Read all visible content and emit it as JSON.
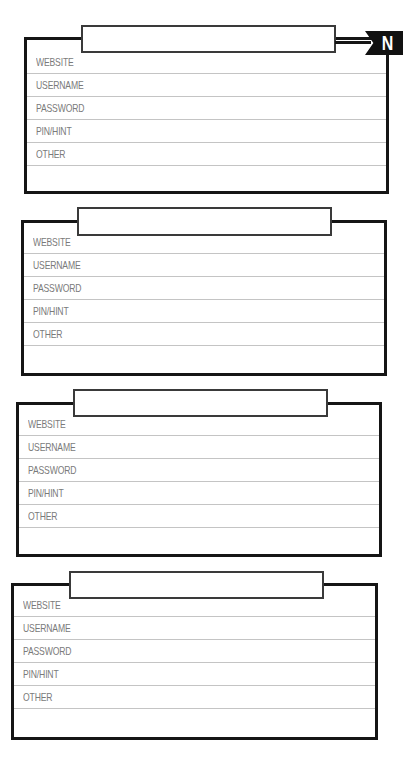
{
  "badge": {
    "letter": "N"
  },
  "cards": [
    {
      "tab_value": "",
      "fields": [
        {
          "label": "WEBSITE",
          "value": ""
        },
        {
          "label": "USERNAME",
          "value": ""
        },
        {
          "label": "PASSWORD",
          "value": ""
        },
        {
          "label": "PIN/HINT",
          "value": ""
        },
        {
          "label": "OTHER",
          "value": ""
        }
      ]
    },
    {
      "tab_value": "",
      "fields": [
        {
          "label": "WEBSITE",
          "value": ""
        },
        {
          "label": "USERNAME",
          "value": ""
        },
        {
          "label": "PASSWORD",
          "value": ""
        },
        {
          "label": "PIN/HINT",
          "value": ""
        },
        {
          "label": "OTHER",
          "value": ""
        }
      ]
    },
    {
      "tab_value": "",
      "fields": [
        {
          "label": "WEBSITE",
          "value": ""
        },
        {
          "label": "USERNAME",
          "value": ""
        },
        {
          "label": "PASSWORD",
          "value": ""
        },
        {
          "label": "PIN/HINT",
          "value": ""
        },
        {
          "label": "OTHER",
          "value": ""
        }
      ]
    },
    {
      "tab_value": "",
      "fields": [
        {
          "label": "WEBSITE",
          "value": ""
        },
        {
          "label": "USERNAME",
          "value": ""
        },
        {
          "label": "PASSWORD",
          "value": ""
        },
        {
          "label": "PIN/HINT",
          "value": ""
        },
        {
          "label": "OTHER",
          "value": ""
        }
      ]
    }
  ]
}
